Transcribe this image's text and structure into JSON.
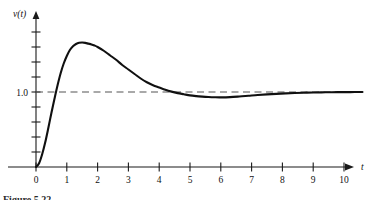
{
  "figure": {
    "caption": "Figure 5.22",
    "background_color": "#ffffff",
    "ink_color": "#101010",
    "asymptote_color": "#555555"
  },
  "axes": {
    "x_axis_name": "t",
    "y_axis_name": "v(t)",
    "x_tick_labels": [
      "0",
      "1",
      "2",
      "3",
      "4",
      "5",
      "6",
      "7",
      "8",
      "9",
      "10"
    ],
    "y_tick_labels": [
      "1.0"
    ],
    "x_range": [
      -0.35,
      11.2
    ],
    "y_range": [
      -0.2,
      2.0
    ],
    "y_tick_step": 0.2,
    "y_tick_count": 9,
    "grid": false
  },
  "annotations": {
    "asymptote_label": "1.0",
    "asymptote_value": 1.0
  },
  "chart_data": {
    "type": "line",
    "title": "Figure 5.22",
    "xlabel": "t",
    "ylabel": "v(t)",
    "xlim": [
      -0.35,
      11.2
    ],
    "ylim": [
      -0.2,
      2.0
    ],
    "grid": false,
    "legend": null,
    "reference_lines": [
      {
        "name": "steady-state-asymptote",
        "orientation": "horizontal",
        "value": 1.0,
        "label": "1.0",
        "style": "dashed",
        "x_start": 0,
        "x_end": 10.6
      }
    ],
    "series": [
      {
        "name": "v(t)",
        "x": [
          0.0,
          0.1,
          0.2,
          0.3,
          0.4,
          0.5,
          0.6,
          0.7,
          0.8,
          0.9,
          1.0,
          1.1,
          1.2,
          1.3,
          1.4,
          1.5,
          1.6,
          1.7,
          1.8,
          1.9,
          2.0,
          2.2,
          2.4,
          2.6,
          2.8,
          3.0,
          3.2,
          3.4,
          3.6,
          3.8,
          4.0,
          4.2,
          4.4,
          4.6,
          4.8,
          5.0,
          5.2,
          5.4,
          5.6,
          5.8,
          6.0,
          6.3,
          6.6,
          6.9,
          7.2,
          7.5,
          7.8,
          8.1,
          8.4,
          8.7,
          9.0,
          9.4,
          9.8,
          10.2,
          10.6
        ],
        "y": [
          0.0,
          0.05,
          0.17,
          0.33,
          0.52,
          0.72,
          0.91,
          1.09,
          1.25,
          1.38,
          1.48,
          1.56,
          1.61,
          1.64,
          1.656,
          1.66,
          1.655,
          1.645,
          1.635,
          1.62,
          1.6,
          1.55,
          1.49,
          1.43,
          1.36,
          1.3,
          1.24,
          1.18,
          1.13,
          1.09,
          1.06,
          1.03,
          1.005,
          0.985,
          0.97,
          0.955,
          0.945,
          0.938,
          0.933,
          0.93,
          0.929,
          0.932,
          0.94,
          0.95,
          0.96,
          0.968,
          0.975,
          0.981,
          0.986,
          0.99,
          0.993,
          0.996,
          0.998,
          0.999,
          1.0
        ]
      }
    ],
    "key_points": [
      {
        "name": "start",
        "x": 0.0,
        "y": 0.0
      },
      {
        "name": "peak-overshoot",
        "x": 1.5,
        "y": 1.66
      },
      {
        "name": "first-crossing",
        "x": 4.4,
        "y": 1.0
      },
      {
        "name": "undershoot-minimum",
        "x": 5.9,
        "y": 0.93
      },
      {
        "name": "settling",
        "x": 10.6,
        "y": 1.0
      }
    ]
  }
}
